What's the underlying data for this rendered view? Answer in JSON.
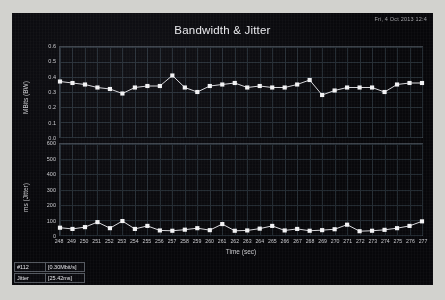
{
  "window": {
    "timestamp": "Fri, 4 Oct 2013 12:4",
    "title": "Bandwidth & Jitter"
  },
  "axes": {
    "top": {
      "ylabel": "MBits (BW)",
      "yticks": [
        "0.6",
        "0.5",
        "0.4",
        "0.3",
        "0.2",
        "0.1",
        "0.0"
      ],
      "ylim": [
        0,
        0.6
      ]
    },
    "bottom": {
      "ylabel": "ms (Jitter)",
      "yticks": [
        "600",
        "500",
        "400",
        "300",
        "200",
        "100",
        "0"
      ],
      "ylim": [
        0,
        600
      ]
    },
    "xlabel": "Time (sec)",
    "xticks": [
      "248",
      "249",
      "250",
      "251",
      "252",
      "253",
      "254",
      "255",
      "256",
      "257",
      "258",
      "259",
      "260",
      "261",
      "262",
      "263",
      "264",
      "265",
      "266",
      "267",
      "268",
      "269",
      "270",
      "271",
      "272",
      "273",
      "274",
      "275",
      "276",
      "277"
    ]
  },
  "legend": [
    {
      "name": "#112",
      "value": "[0.30Mbit/s]"
    },
    {
      "name": "Jitter",
      "value": "[25.42ms]"
    }
  ],
  "colors": {
    "panel_background": "#07070a",
    "series_line": "#d8d8dc",
    "series_marker": "#f2f2f4",
    "grid": "#222a31",
    "text": "#c9c9cd",
    "title": "#e8e8ec",
    "page_background": "#d2d2ce"
  },
  "chart_data": {
    "type": "line",
    "title": "Bandwidth & Jitter",
    "xlabel": "Time (sec)",
    "grid": true,
    "legend_position": "bottom-left",
    "x": [
      248,
      249,
      250,
      251,
      252,
      253,
      254,
      255,
      256,
      257,
      258,
      259,
      260,
      261,
      262,
      263,
      264,
      265,
      266,
      267,
      268,
      269,
      270,
      271,
      272,
      273,
      274,
      275,
      276,
      277
    ],
    "panels": [
      {
        "ylabel": "MBits (BW)",
        "ylim": [
          0,
          0.6
        ],
        "series": [
          {
            "name": "#112",
            "values": [
              0.37,
              0.36,
              0.35,
              0.33,
              0.32,
              0.29,
              0.33,
              0.34,
              0.34,
              0.41,
              0.33,
              0.3,
              0.34,
              0.35,
              0.36,
              0.33,
              0.34,
              0.33,
              0.33,
              0.35,
              0.38,
              0.28,
              0.31,
              0.33,
              0.33,
              0.33,
              0.3,
              0.35,
              0.36,
              0.36
            ]
          }
        ]
      },
      {
        "ylabel": "ms (Jitter)",
        "ylim": [
          0,
          600
        ],
        "series": [
          {
            "name": "Jitter",
            "values": [
              48,
              40,
              52,
              85,
              45,
              92,
              40,
              60,
              30,
              28,
              35,
              45,
              32,
              72,
              28,
              30,
              42,
              60,
              30,
              40,
              28,
              32,
              38,
              68,
              25,
              28,
              34,
              45,
              60,
              90
            ]
          }
        ]
      }
    ]
  }
}
